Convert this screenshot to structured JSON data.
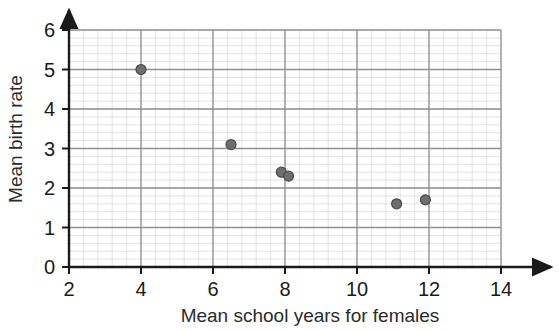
{
  "chart_data": {
    "type": "scatter",
    "title": "",
    "xlabel": "Mean school years for females",
    "ylabel": "Mean birth rate",
    "xlim": [
      2,
      14
    ],
    "ylim": [
      0,
      6
    ],
    "xticks": [
      2,
      4,
      6,
      8,
      10,
      12,
      14
    ],
    "xtick_labels": [
      "2",
      "4",
      "6",
      "8",
      "10",
      "12",
      "14"
    ],
    "yticks": [
      0,
      1,
      2,
      3,
      4,
      5,
      6
    ],
    "ytick_labels": [
      "0",
      "1",
      "2",
      "3",
      "4",
      "5",
      "6"
    ],
    "x_minor_step": 0.4,
    "y_minor_step": 0.2,
    "grid": true,
    "legend": "none",
    "marker_color": "#6e6e6e",
    "marker_edge_color": "#4a4a4a",
    "marker_size": 10,
    "axis_color": "#1a1a1a",
    "major_grid_color": "#8f8f96",
    "minor_grid_color": "#d9d4d4",
    "points": [
      {
        "x": 4.0,
        "y": 5.0
      },
      {
        "x": 6.5,
        "y": 3.1
      },
      {
        "x": 7.9,
        "y": 2.4
      },
      {
        "x": 8.1,
        "y": 2.3
      },
      {
        "x": 11.1,
        "y": 1.6
      },
      {
        "x": 11.9,
        "y": 1.7
      }
    ]
  }
}
